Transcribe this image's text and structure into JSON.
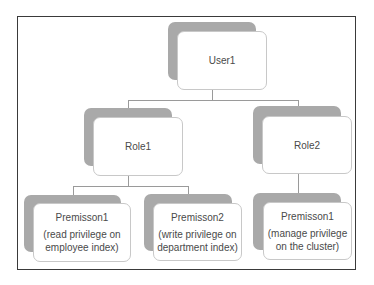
{
  "diagram": {
    "type": "hierarchy",
    "colors": {
      "frame": "#3a3a3a",
      "shadow": "#a9a9a9",
      "card_bg": "#ffffff",
      "card_border": "#c8c8c8",
      "text": "#4a4a4a",
      "connector": "#9a9a9a"
    },
    "user": {
      "title": "User1"
    },
    "roles": [
      {
        "title": "Role1"
      },
      {
        "title": "Role2"
      }
    ],
    "permissions": [
      {
        "title": "Premisson1",
        "line1": "(read privilege on",
        "line2": "employee index)"
      },
      {
        "title": "Premisson2",
        "line1": "(write privilege on",
        "line2": "department index)"
      },
      {
        "title": "Premisson1",
        "line1": "(manage privilege",
        "line2": "on the cluster)"
      }
    ]
  }
}
